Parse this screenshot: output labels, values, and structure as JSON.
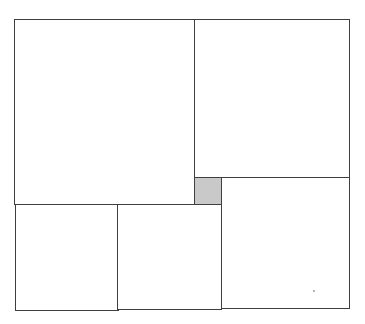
{
  "diagram": {
    "type": "squared-rectangle-dissection",
    "unit_px": 26,
    "outer": {
      "x": 14,
      "y": 19,
      "w": 336,
      "h": 291,
      "width_units": 13,
      "height_units": 11
    },
    "colors": {
      "stroke": "#3f3f3f",
      "fill": "#ffffff",
      "shaded_fill": "#c9c9c9"
    },
    "squares": [
      {
        "id": "large-top-left",
        "side_units": 7,
        "x": 14,
        "y": 19,
        "w": 181,
        "h": 186,
        "shaded": false
      },
      {
        "id": "top-right",
        "side_units": 6,
        "x": 194,
        "y": 19,
        "w": 156,
        "h": 159,
        "shaded": false
      },
      {
        "id": "small-center",
        "side_units": 1,
        "x": 194,
        "y": 177,
        "w": 28,
        "h": 28,
        "shaded": true
      },
      {
        "id": "bottom-right",
        "side_units": 5,
        "x": 221,
        "y": 177,
        "w": 129,
        "h": 132,
        "shaded": false
      },
      {
        "id": "bottom-left",
        "side_units": 4,
        "x": 15,
        "y": 204,
        "w": 104,
        "h": 107,
        "shaded": false
      },
      {
        "id": "bottom-middle",
        "side_units": 4,
        "x": 117,
        "y": 204,
        "w": 105,
        "h": 106,
        "shaded": false
      }
    ]
  }
}
